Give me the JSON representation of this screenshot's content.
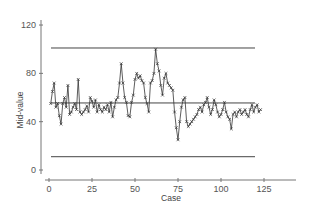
{
  "chart_data": {
    "type": "line",
    "title": "",
    "xlabel": "Case",
    "ylabel": "Mid-value",
    "xlim": [
      0,
      145
    ],
    "ylim": [
      0,
      120
    ],
    "x_ticks": [
      0,
      25,
      50,
      75,
      100,
      125
    ],
    "y_ticks": [
      0,
      40,
      80,
      120
    ],
    "grid": false,
    "legend": null,
    "marker": "x",
    "reference_lines": [
      {
        "name": "upper-control-limit",
        "value": 101,
        "x_start": 1,
        "x_end": 120
      },
      {
        "name": "center-line",
        "value": 55.5,
        "x_start": 1,
        "x_end": 120
      },
      {
        "name": "lower-control-limit",
        "value": 11,
        "x_start": 1,
        "x_end": 120
      }
    ],
    "series": [
      {
        "name": "Mid-value",
        "x_start": 1,
        "values": [
          55,
          65,
          72,
          52,
          55,
          45,
          38,
          55,
          60,
          52,
          70,
          46,
          48,
          52,
          55,
          50,
          75,
          48,
          46,
          48,
          50,
          53,
          48,
          60,
          57,
          52,
          58,
          48,
          54,
          50,
          48,
          52,
          50,
          54,
          48,
          56,
          44,
          52,
          58,
          60,
          72,
          88,
          72,
          60,
          56,
          45,
          44,
          56,
          62,
          75,
          80,
          76,
          78,
          74,
          72,
          60,
          55,
          48,
          72,
          74,
          80,
          100,
          88,
          82,
          70,
          62,
          76,
          80,
          72,
          70,
          68,
          66,
          48,
          35,
          25,
          40,
          52,
          58,
          60,
          40,
          36,
          38,
          40,
          42,
          44,
          46,
          50,
          52,
          48,
          54,
          56,
          60,
          52,
          46,
          50,
          58,
          54,
          48,
          44,
          46,
          50,
          56,
          48,
          44,
          42,
          34,
          46,
          48,
          44,
          48,
          50,
          46,
          48,
          50,
          46,
          44,
          50,
          54,
          48,
          52,
          54,
          48,
          50
        ]
      }
    ]
  },
  "colors": {
    "axis": "#777777",
    "line": "#333333",
    "reference": "#444444",
    "text": "#555555"
  }
}
